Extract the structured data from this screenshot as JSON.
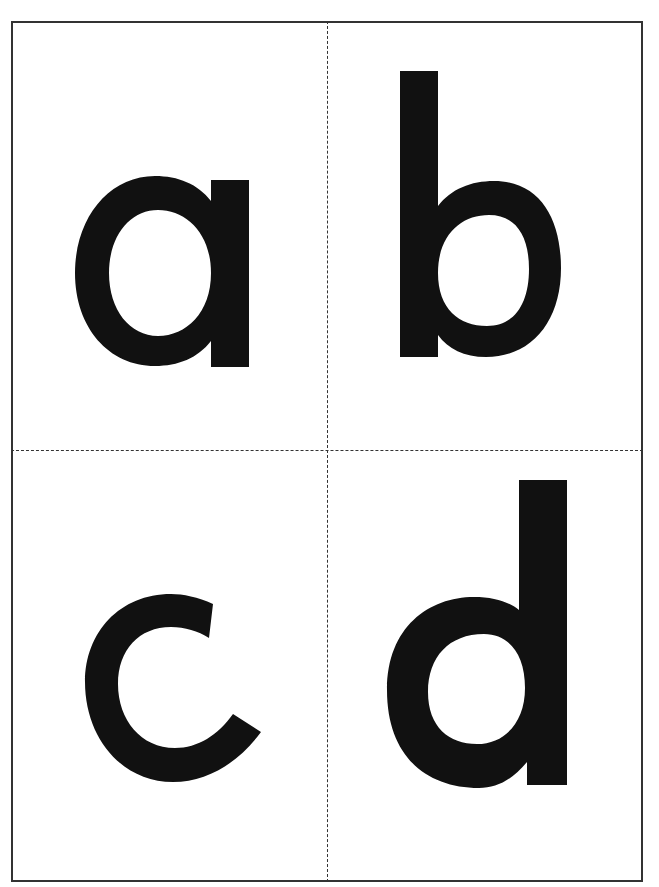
{
  "cards": [
    {
      "letter": "a",
      "position": "top-left"
    },
    {
      "letter": "b",
      "position": "top-right"
    },
    {
      "letter": "c",
      "position": "bottom-left"
    },
    {
      "letter": "d",
      "position": "bottom-right"
    }
  ],
  "colors": {
    "ink": "#111111",
    "border": "#333333",
    "paper": "#ffffff"
  }
}
